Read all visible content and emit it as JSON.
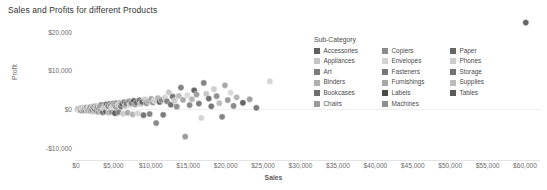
{
  "header": {
    "title": "Sales and Profits for different Products"
  },
  "legend": {
    "title": "Sub-Category",
    "columns": [
      [
        {
          "label": "Accessories",
          "color": "#5f5f5f"
        },
        {
          "label": "Appliances",
          "color": "#c4c4c4"
        },
        {
          "label": "Art",
          "color": "#7d7d7d"
        },
        {
          "label": "Binders",
          "color": "#b0b0b0"
        },
        {
          "label": "Bookcases",
          "color": "#6e6e6e"
        },
        {
          "label": "Chairs",
          "color": "#9a9a9a"
        }
      ],
      [
        {
          "label": "Copiers",
          "color": "#8a8a8a"
        },
        {
          "label": "Envelopes",
          "color": "#d2d2d2"
        },
        {
          "label": "Fasteners",
          "color": "#767676"
        },
        {
          "label": "Furnishings",
          "color": "#a8a8a8"
        },
        {
          "label": "Labels",
          "color": "#4a4a4a"
        },
        {
          "label": "Machines",
          "color": "#8f8f8f"
        }
      ],
      [
        {
          "label": "Paper",
          "color": "#656565"
        },
        {
          "label": "Phones",
          "color": "#cdcdcd"
        },
        {
          "label": "Storage",
          "color": "#707070"
        },
        {
          "label": "Supplies",
          "color": "#bdbdbd"
        },
        {
          "label": "Tables",
          "color": "#5a5a5a"
        }
      ]
    ]
  },
  "chart_data": {
    "type": "scatter",
    "title": "Sales and Profits for different Products",
    "xlabel": "Sales",
    "ylabel": "Profit",
    "xlim": [
      0,
      62000
    ],
    "ylim": [
      -13000,
      24000
    ],
    "xticks": [
      "$0",
      "$5,000",
      "$10,000",
      "$15,000",
      "$20,000",
      "$25,000",
      "$30,000",
      "$35,000",
      "$40,000",
      "$45,000",
      "$50,000",
      "$55,000",
      "$60,000"
    ],
    "xtick_values": [
      0,
      5000,
      10000,
      15000,
      20000,
      25000,
      30000,
      35000,
      40000,
      45000,
      50000,
      55000,
      60000
    ],
    "yticks": [
      "$20,000",
      "$10,000",
      "$0",
      "-$10,000"
    ],
    "ytick_values": [
      20000,
      10000,
      0,
      -10000
    ],
    "grid": "zero-line-only",
    "legend_position": "top-right-inside",
    "marker": {
      "shape": "circle",
      "radius_px": 3.1,
      "opacity": 0.85
    },
    "series": [
      {
        "name": "Sub-Category",
        "points": [
          {
            "x": 250,
            "y": 60,
            "c": "#7d7d7d"
          },
          {
            "x": 330,
            "y": 95,
            "c": "#9a9a9a"
          },
          {
            "x": 410,
            "y": -120,
            "c": "#b0b0b0"
          },
          {
            "x": 480,
            "y": 150,
            "c": "#6e6e6e"
          },
          {
            "x": 520,
            "y": -60,
            "c": "#c4c4c4"
          },
          {
            "x": 600,
            "y": 210,
            "c": "#8a8a8a"
          },
          {
            "x": 660,
            "y": 30,
            "c": "#a8a8a8"
          },
          {
            "x": 720,
            "y": -200,
            "c": "#4a4a4a"
          },
          {
            "x": 780,
            "y": 260,
            "c": "#767676"
          },
          {
            "x": 840,
            "y": 110,
            "c": "#d2d2d2"
          },
          {
            "x": 900,
            "y": -90,
            "c": "#8f8f8f"
          },
          {
            "x": 960,
            "y": 320,
            "c": "#656565"
          },
          {
            "x": 1010,
            "y": 180,
            "c": "#cdcdcd"
          },
          {
            "x": 1080,
            "y": -260,
            "c": "#707070"
          },
          {
            "x": 1150,
            "y": 400,
            "c": "#bdbdbd"
          },
          {
            "x": 1210,
            "y": 70,
            "c": "#5a5a5a"
          },
          {
            "x": 1280,
            "y": -150,
            "c": "#5f5f5f"
          },
          {
            "x": 1350,
            "y": 290,
            "c": "#c4c4c4"
          },
          {
            "x": 1420,
            "y": 480,
            "c": "#7d7d7d"
          },
          {
            "x": 1490,
            "y": -330,
            "c": "#b0b0b0"
          },
          {
            "x": 1560,
            "y": 140,
            "c": "#6e6e6e"
          },
          {
            "x": 1630,
            "y": 360,
            "c": "#9a9a9a"
          },
          {
            "x": 1700,
            "y": -80,
            "c": "#8a8a8a"
          },
          {
            "x": 1780,
            "y": 520,
            "c": "#d2d2d2"
          },
          {
            "x": 1850,
            "y": 220,
            "c": "#767676"
          },
          {
            "x": 1920,
            "y": -420,
            "c": "#a8a8a8"
          },
          {
            "x": 2000,
            "y": 610,
            "c": "#4a4a4a"
          },
          {
            "x": 2080,
            "y": 300,
            "c": "#8f8f8f"
          },
          {
            "x": 2150,
            "y": -190,
            "c": "#656565"
          },
          {
            "x": 2230,
            "y": 700,
            "c": "#cdcdcd"
          },
          {
            "x": 2300,
            "y": 420,
            "c": "#707070"
          },
          {
            "x": 2380,
            "y": -520,
            "c": "#bdbdbd"
          },
          {
            "x": 2460,
            "y": 180,
            "c": "#5a5a5a"
          },
          {
            "x": 2540,
            "y": 790,
            "c": "#5f5f5f"
          },
          {
            "x": 2620,
            "y": 480,
            "c": "#c4c4c4"
          },
          {
            "x": 2700,
            "y": -300,
            "c": "#7d7d7d"
          },
          {
            "x": 2790,
            "y": 880,
            "c": "#b0b0b0"
          },
          {
            "x": 2870,
            "y": 560,
            "c": "#6e6e6e"
          },
          {
            "x": 2950,
            "y": -640,
            "c": "#9a9a9a"
          },
          {
            "x": 3040,
            "y": 310,
            "c": "#8a8a8a"
          },
          {
            "x": 3130,
            "y": 960,
            "c": "#d2d2d2"
          },
          {
            "x": 3220,
            "y": 650,
            "c": "#767676"
          },
          {
            "x": 3310,
            "y": -420,
            "c": "#a8a8a8"
          },
          {
            "x": 3400,
            "y": 1080,
            "c": "#4a4a4a"
          },
          {
            "x": 3490,
            "y": 740,
            "c": "#8f8f8f"
          },
          {
            "x": 3580,
            "y": -760,
            "c": "#656565"
          },
          {
            "x": 3680,
            "y": 390,
            "c": "#cdcdcd"
          },
          {
            "x": 3780,
            "y": 1180,
            "c": "#707070"
          },
          {
            "x": 3880,
            "y": 820,
            "c": "#bdbdbd"
          },
          {
            "x": 3980,
            "y": -540,
            "c": "#5a5a5a"
          },
          {
            "x": 4080,
            "y": 1290,
            "c": "#5f5f5f"
          },
          {
            "x": 4180,
            "y": 470,
            "c": "#c4c4c4"
          },
          {
            "x": 4290,
            "y": 900,
            "c": "#7d7d7d"
          },
          {
            "x": 4400,
            "y": -880,
            "c": "#b0b0b0"
          },
          {
            "x": 4510,
            "y": 1400,
            "c": "#6e6e6e"
          },
          {
            "x": 4620,
            "y": 1010,
            "c": "#9a9a9a"
          },
          {
            "x": 4730,
            "y": -620,
            "c": "#8a8a8a"
          },
          {
            "x": 4850,
            "y": 560,
            "c": "#d2d2d2"
          },
          {
            "x": 4970,
            "y": 1520,
            "c": "#767676"
          },
          {
            "x": 5090,
            "y": 1120,
            "c": "#a8a8a8"
          },
          {
            "x": 5210,
            "y": -980,
            "c": "#4a4a4a"
          },
          {
            "x": 5340,
            "y": 660,
            "c": "#8f8f8f"
          },
          {
            "x": 5470,
            "y": 1640,
            "c": "#656565"
          },
          {
            "x": 5600,
            "y": 1240,
            "c": "#cdcdcd"
          },
          {
            "x": 5730,
            "y": -720,
            "c": "#707070"
          },
          {
            "x": 5870,
            "y": 1780,
            "c": "#bdbdbd"
          },
          {
            "x": 6010,
            "y": 780,
            "c": "#5a5a5a"
          },
          {
            "x": 6150,
            "y": 1360,
            "c": "#5f5f5f"
          },
          {
            "x": 6290,
            "y": -1120,
            "c": "#c4c4c4"
          },
          {
            "x": 6440,
            "y": 1900,
            "c": "#7d7d7d"
          },
          {
            "x": 6590,
            "y": 920,
            "c": "#b0b0b0"
          },
          {
            "x": 6740,
            "y": 1480,
            "c": "#6e6e6e"
          },
          {
            "x": 6900,
            "y": -860,
            "c": "#9a9a9a"
          },
          {
            "x": 7060,
            "y": 2050,
            "c": "#8a8a8a"
          },
          {
            "x": 7220,
            "y": 1090,
            "c": "#d2d2d2"
          },
          {
            "x": 7390,
            "y": 1620,
            "c": "#767676"
          },
          {
            "x": 7560,
            "y": -1300,
            "c": "#a8a8a8"
          },
          {
            "x": 7730,
            "y": 2200,
            "c": "#4a4a4a"
          },
          {
            "x": 7900,
            "y": 1250,
            "c": "#8f8f8f"
          },
          {
            "x": 8080,
            "y": 1760,
            "c": "#656565"
          },
          {
            "x": 8260,
            "y": -1000,
            "c": "#cdcdcd"
          },
          {
            "x": 8450,
            "y": 2380,
            "c": "#707070"
          },
          {
            "x": 8640,
            "y": 1420,
            "c": "#bdbdbd"
          },
          {
            "x": 8830,
            "y": 1920,
            "c": "#5a5a5a"
          },
          {
            "x": 9020,
            "y": -1480,
            "c": "#5f5f5f"
          },
          {
            "x": 9220,
            "y": 2560,
            "c": "#c4c4c4"
          },
          {
            "x": 9420,
            "y": 1590,
            "c": "#7d7d7d"
          },
          {
            "x": 9630,
            "y": 2090,
            "c": "#b0b0b0"
          },
          {
            "x": 9840,
            "y": -1180,
            "c": "#6e6e6e"
          },
          {
            "x": 10050,
            "y": 2740,
            "c": "#9a9a9a"
          },
          {
            "x": 10270,
            "y": 1760,
            "c": "#8a8a8a"
          },
          {
            "x": 10490,
            "y": 2260,
            "c": "#d2d2d2"
          },
          {
            "x": 10710,
            "y": -3500,
            "c": "#767676"
          },
          {
            "x": 10940,
            "y": 2920,
            "c": "#a8a8a8"
          },
          {
            "x": 11170,
            "y": 1930,
            "c": "#4a4a4a"
          },
          {
            "x": 11410,
            "y": 2430,
            "c": "#8f8f8f"
          },
          {
            "x": 11650,
            "y": -1400,
            "c": "#656565"
          },
          {
            "x": 11900,
            "y": 3100,
            "c": "#cdcdcd"
          },
          {
            "x": 12150,
            "y": 2100,
            "c": "#707070"
          },
          {
            "x": 12400,
            "y": 4400,
            "c": "#bdbdbd"
          },
          {
            "x": 12660,
            "y": 1200,
            "c": "#5a5a5a"
          },
          {
            "x": 12920,
            "y": 3280,
            "c": "#5f5f5f"
          },
          {
            "x": 13190,
            "y": 2270,
            "c": "#c4c4c4"
          },
          {
            "x": 13460,
            "y": 700,
            "c": "#7d7d7d"
          },
          {
            "x": 13740,
            "y": 3460,
            "c": "#b0b0b0"
          },
          {
            "x": 14020,
            "y": 5600,
            "c": "#6e6e6e"
          },
          {
            "x": 14300,
            "y": 2440,
            "c": "#9a9a9a"
          },
          {
            "x": 14590,
            "y": -7000,
            "c": "#8a8a8a"
          },
          {
            "x": 14880,
            "y": 3640,
            "c": "#d2d2d2"
          },
          {
            "x": 15180,
            "y": 1100,
            "c": "#767676"
          },
          {
            "x": 15480,
            "y": 2610,
            "c": "#a8a8a8"
          },
          {
            "x": 15790,
            "y": 4900,
            "c": "#4a4a4a"
          },
          {
            "x": 16100,
            "y": 3820,
            "c": "#8f8f8f"
          },
          {
            "x": 16420,
            "y": 1500,
            "c": "#656565"
          },
          {
            "x": 16740,
            "y": -2200,
            "c": "#cdcdcd"
          },
          {
            "x": 17070,
            "y": 6800,
            "c": "#707070"
          },
          {
            "x": 17400,
            "y": 4000,
            "c": "#bdbdbd"
          },
          {
            "x": 17740,
            "y": 2780,
            "c": "#5a5a5a"
          },
          {
            "x": 18080,
            "y": 800,
            "c": "#5f5f5f"
          },
          {
            "x": 18430,
            "y": 5200,
            "c": "#c4c4c4"
          },
          {
            "x": 18790,
            "y": 3400,
            "c": "#7d7d7d"
          },
          {
            "x": 19150,
            "y": 1600,
            "c": "#b0b0b0"
          },
          {
            "x": 19520,
            "y": -1900,
            "c": "#6e6e6e"
          },
          {
            "x": 19900,
            "y": 6200,
            "c": "#9a9a9a"
          },
          {
            "x": 20280,
            "y": 2400,
            "c": "#8a8a8a"
          },
          {
            "x": 20670,
            "y": 4300,
            "c": "#d2d2d2"
          },
          {
            "x": 21060,
            "y": 900,
            "c": "#767676"
          },
          {
            "x": 21460,
            "y": 3100,
            "c": "#a8a8a8"
          },
          {
            "x": 22300,
            "y": 1700,
            "c": "#4a4a4a"
          },
          {
            "x": 23200,
            "y": 2600,
            "c": "#8f8f8f"
          },
          {
            "x": 24100,
            "y": 400,
            "c": "#656565"
          },
          {
            "x": 25900,
            "y": 7200,
            "c": "#cdcdcd"
          },
          {
            "x": 60100,
            "y": 22300,
            "c": "#4a4a4a"
          }
        ]
      }
    ]
  }
}
